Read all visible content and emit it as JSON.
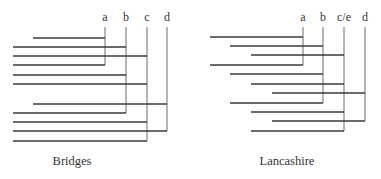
{
  "panels": [
    {
      "id": "bridges",
      "caption": "Bridges",
      "caption_x": 72,
      "columns": [
        {
          "label": "a",
          "x": 105,
          "bottom": 65
        },
        {
          "label": "b",
          "x": 126,
          "bottom": 113
        },
        {
          "label": "c",
          "x": 147,
          "bottom": 141
        },
        {
          "label": "d",
          "x": 167,
          "bottom": 131
        }
      ],
      "rows": [
        {
          "y": 38,
          "x_start": 33,
          "target": 0
        },
        {
          "y": 47,
          "x_start": 13,
          "target": 1
        },
        {
          "y": 56,
          "x_start": 13,
          "target": 2
        },
        {
          "y": 65,
          "x_start": 13,
          "target": 0
        },
        {
          "y": 75,
          "x_start": 13,
          "target": 1
        },
        {
          "y": 84,
          "x_start": 13,
          "target": 2
        },
        {
          "y": 104,
          "x_start": 33,
          "target": 3
        },
        {
          "y": 113,
          "x_start": 13,
          "target": 1
        },
        {
          "y": 122,
          "x_start": 13,
          "target": 2
        },
        {
          "y": 131,
          "x_start": 13,
          "target": 3
        },
        {
          "y": 141,
          "x_start": 13,
          "target": 2
        }
      ]
    },
    {
      "id": "lancashire",
      "caption": "Lancashire",
      "caption_x": 287,
      "columns": [
        {
          "label": "a",
          "x": 303,
          "bottom": 65
        },
        {
          "label": "b",
          "x": 323,
          "bottom": 103
        },
        {
          "label": "c/e",
          "x": 344,
          "bottom": 131
        },
        {
          "label": "d",
          "x": 365,
          "bottom": 121
        }
      ],
      "rows": [
        {
          "y": 37,
          "x_start": 210,
          "target": 0
        },
        {
          "y": 46,
          "x_start": 230,
          "target": 1
        },
        {
          "y": 55,
          "x_start": 251,
          "target": 2
        },
        {
          "y": 65,
          "x_start": 210,
          "target": 0
        },
        {
          "y": 74,
          "x_start": 230,
          "target": 1
        },
        {
          "y": 84,
          "x_start": 251,
          "target": 2
        },
        {
          "y": 93,
          "x_start": 272,
          "target": 3
        },
        {
          "y": 103,
          "x_start": 230,
          "target": 1
        },
        {
          "y": 112,
          "x_start": 251,
          "target": 2
        },
        {
          "y": 121,
          "x_start": 272,
          "target": 3
        },
        {
          "y": 131,
          "x_start": 251,
          "target": 2
        }
      ]
    }
  ],
  "layout": {
    "label_y": 21,
    "column_top": 27,
    "caption_y": 165
  }
}
